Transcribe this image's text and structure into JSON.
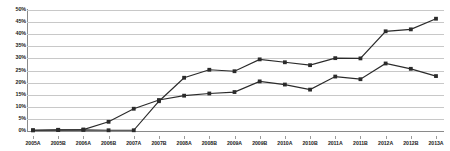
{
  "chart_data": {
    "type": "line",
    "title": "",
    "subtitle": "",
    "xlabel": "",
    "ylabel": "",
    "ylim": [
      0,
      50
    ],
    "ytick_labels": [
      "0%",
      "5%",
      "10%",
      "15%",
      "20%",
      "25%",
      "30%",
      "35%",
      "40%",
      "45%",
      "50%"
    ],
    "ytick_values": [
      0,
      5,
      10,
      15,
      20,
      25,
      30,
      35,
      40,
      45,
      50
    ],
    "grid": true,
    "legend": "none",
    "marker": "square",
    "line_color": "#2b2b2b",
    "grid_color": "#c8c8c8",
    "categories": [
      "2005A",
      "2005B",
      "2006A",
      "2006B",
      "2007A",
      "2007B",
      "2008A",
      "2008B",
      "2009A",
      "2009B",
      "2010A",
      "2010B",
      "2011A",
      "2011B",
      "2012A",
      "2012B",
      "2013A"
    ],
    "series": [
      {
        "name": "Series 1",
        "values": [
          0.3,
          0.4,
          0.5,
          0.3,
          0.3,
          12.3,
          22.0,
          25.3,
          24.7,
          29.6,
          28.4,
          27.2,
          30.1,
          30.0,
          41.2,
          42.0,
          46.4
        ]
      },
      {
        "name": "Series 2",
        "values": [
          0.3,
          0.5,
          0.6,
          3.8,
          9.2,
          12.8,
          14.6,
          15.5,
          16.1,
          20.5,
          19.2,
          17.1,
          22.5,
          21.4,
          27.9,
          25.7,
          22.7
        ]
      }
    ]
  }
}
